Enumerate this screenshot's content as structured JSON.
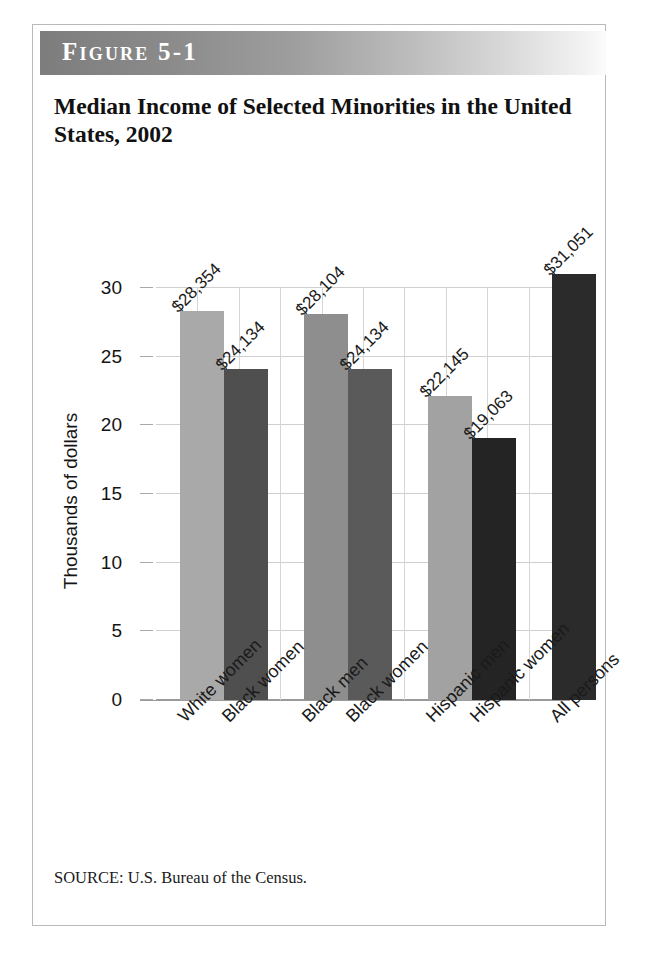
{
  "figure": {
    "label": "Figure 5-1",
    "title": "Median Income of Selected Minorities in the United States, 2002",
    "source": "SOURCE: U.S. Bureau of the Census."
  },
  "chart_data": {
    "type": "bar",
    "title": "Median Income of Selected Minorities in the United States, 2002",
    "xlabel": "",
    "ylabel": "Thousands of dollars",
    "ylim": [
      0,
      33
    ],
    "yticks": [
      "0",
      "5",
      "10",
      "15",
      "20",
      "25",
      "30"
    ],
    "ytick_values": [
      0,
      5,
      10,
      15,
      20,
      25,
      30
    ],
    "grid": true,
    "legend": "none",
    "categories": [
      "White women",
      "Black women",
      "Black men",
      "Black women",
      "Hispanic men",
      "Hispanic women",
      "All persons"
    ],
    "values": [
      28.354,
      24.134,
      28.104,
      24.134,
      22.145,
      19.063,
      31.051
    ],
    "data_labels": [
      "$28,354",
      "$24,134",
      "$28,104",
      "$24,134",
      "$22,145",
      "$19,063",
      "$31,051"
    ],
    "bar_colors": [
      "#a9a9a9",
      "#4f4f4f",
      "#8e8e8e",
      "#5a5a5a",
      "#a2a2a2",
      "#242424",
      "#2b2b2b"
    ],
    "groups": [
      {
        "name": "White women / Black women",
        "indices": [
          0,
          1
        ]
      },
      {
        "name": "Black men / Black women",
        "indices": [
          2,
          3
        ]
      },
      {
        "name": "Hispanic men / Hispanic women",
        "indices": [
          4,
          5
        ]
      },
      {
        "name": "All persons",
        "indices": [
          6
        ]
      }
    ]
  },
  "colors": {
    "header_band_dark": "#7d7d7d",
    "header_band_light": "#fbfbfb",
    "frame_border": "#b9b9b9",
    "gridline": "#cfcfcf",
    "text": "#141414"
  }
}
